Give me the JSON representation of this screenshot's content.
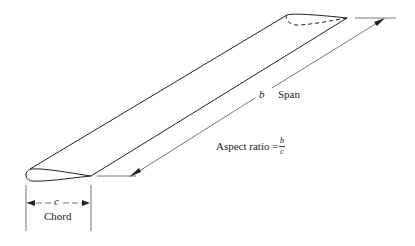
{
  "diagram": {
    "span": {
      "symbol": "b",
      "label": "Span"
    },
    "chord": {
      "symbol": "c",
      "label": "Chord"
    },
    "aspect_ratio": {
      "label": "Aspect ratio =",
      "numerator": "b",
      "denominator": "c"
    },
    "colors": {
      "line": "#222222",
      "dimension_line": "#555555",
      "background": "#ffffff"
    }
  }
}
